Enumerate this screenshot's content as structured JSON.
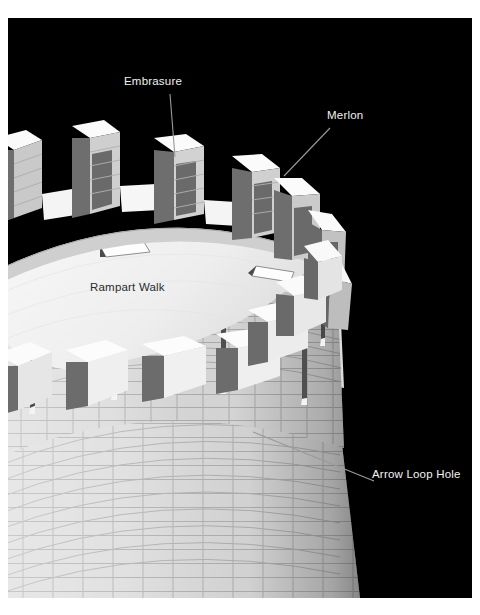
{
  "figure": {
    "background_color": "#000000",
    "page_color": "#ffffff",
    "label_color_on_dark": "#f2f2f2",
    "label_color_on_light": "#2b2b2b",
    "leader_line_color": "#9a9a9a"
  },
  "labels": [
    {
      "id": "embrasure",
      "text": "Embrasure",
      "on_dark": true,
      "x": 124,
      "y": 64,
      "leader": {
        "x1": 162,
        "y1": 76,
        "x2": 167,
        "y2": 139
      }
    },
    {
      "id": "merlon",
      "text": "Merlon",
      "on_dark": true,
      "x": 327,
      "y": 98,
      "leader": {
        "x1": 322,
        "y1": 110,
        "x2": 276,
        "y2": 158
      }
    },
    {
      "id": "rampart_walk",
      "text": "Rampart Walk",
      "on_dark": false,
      "x": 90,
      "y": 270,
      "leader": null
    },
    {
      "id": "arrow_loop_hole",
      "text": "Arrow Loop Hole",
      "on_dark": true,
      "x": 372,
      "y": 457,
      "leader": {
        "x1": 366,
        "y1": 463,
        "x2": 245,
        "y2": 414
      }
    }
  ],
  "palette": {
    "stone_light": "#e9e9e9",
    "stone_mid": "#d3d3d3",
    "stone_shade": "#b9b9b9",
    "stone_dark": "#9c9c9c",
    "band_dark": "#8e8e8e",
    "cap_top": "#fbfbfb",
    "cap_side": "#6f6f6f",
    "merlon_face": "#6e6e6e",
    "walk_floor": "#f3f3f3",
    "mortar": "#a8a8a8",
    "slit_dark": "#4a4a4a"
  },
  "parts": {
    "merlon_count_visible": 13,
    "arrow_loop_count_visible": 6,
    "hatch_count_visible": 2,
    "has_cornice_band": true,
    "has_brick_coursing": true
  }
}
